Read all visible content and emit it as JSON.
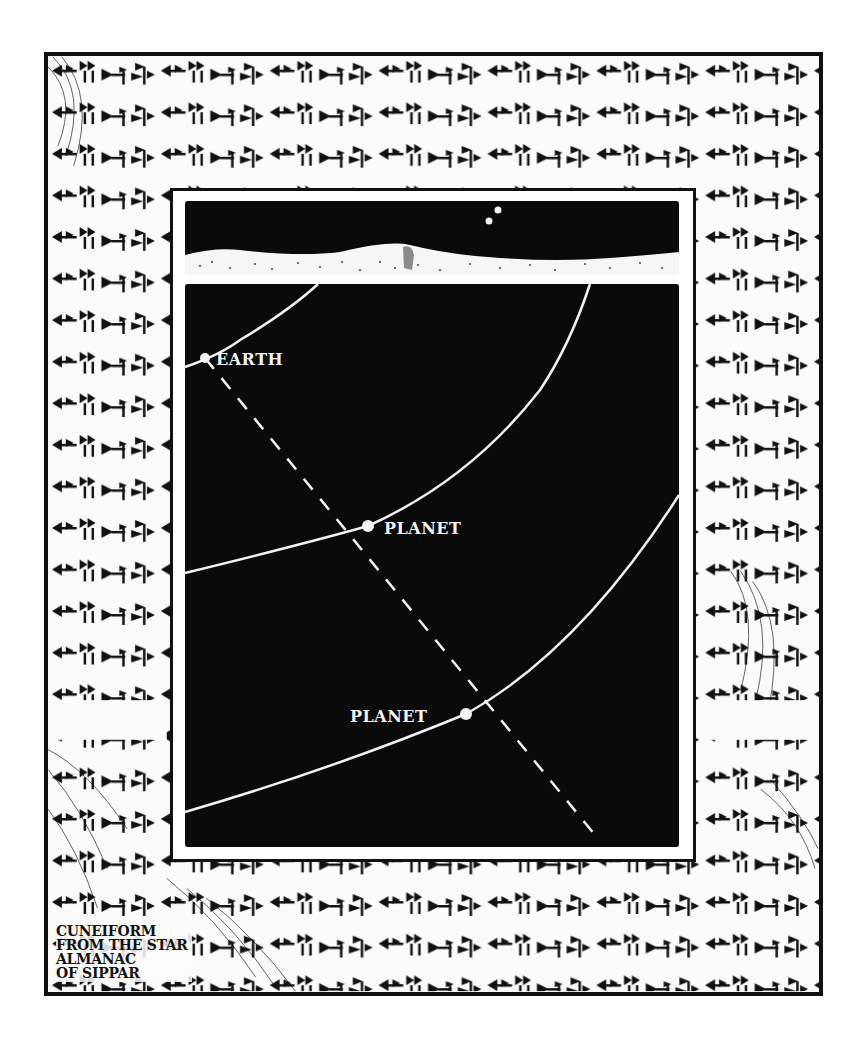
{
  "caption": {
    "lines": [
      "CUNEIFORM",
      "FROM THE STAR",
      "ALMANAC",
      "OF SIPPAR"
    ]
  },
  "diagram": {
    "sky_panel": {
      "description": "night sky over desert dunes with two stars",
      "stars": [
        {
          "x": 495,
          "y": 220
        },
        {
          "x": 488,
          "y": 228
        }
      ]
    },
    "main_panel": {
      "labels": {
        "earth": "EARTH",
        "planet_inner": "PLANET",
        "planet_outer": "PLANET"
      },
      "points": {
        "earth": {
          "x": 205,
          "y": 358
        },
        "planet_inner": {
          "x": 368,
          "y": 526
        },
        "planet_outer": {
          "x": 466,
          "y": 714
        }
      },
      "sight_line": {
        "from": [
          205,
          358
        ],
        "to": [
          595,
          835
        ],
        "style": "dashed"
      }
    },
    "colors": {
      "panel_bg": "#0a0a0a",
      "line": "#f2f2f2",
      "frame": "#111111",
      "paper": "#fbfbfb"
    }
  }
}
